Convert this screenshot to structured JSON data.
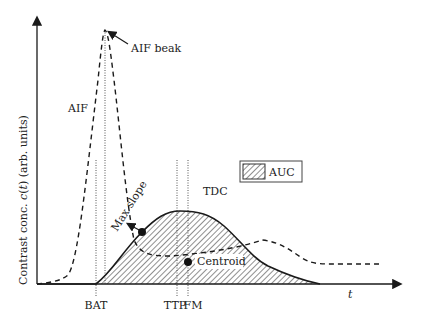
{
  "diagram": {
    "y_axis_label_prefix": "Contrast conc. ",
    "y_axis_label_var": "c",
    "y_axis_label_paren_open": "(",
    "y_axis_label_t": "t",
    "y_axis_label_suffix": ") (arb. units)",
    "x_axis_label": "t",
    "curves": {
      "aif": "AIF",
      "tdc": "TDC"
    },
    "annotations": {
      "aif_peak": "AIF beak",
      "max_slope": "Max slope",
      "centroid": "Centroid"
    },
    "time_markers": [
      "BAT",
      "TTP",
      "FM"
    ],
    "legend": {
      "auc": "AUC"
    },
    "colors": {
      "line": "#1a1a1a",
      "hatch": "#333333",
      "background": "#ffffff"
    }
  }
}
